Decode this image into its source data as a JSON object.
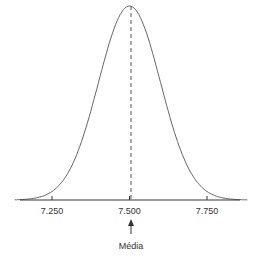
{
  "chart_data": {
    "type": "line",
    "title": "",
    "subtitle": "",
    "xlabel": "",
    "ylabel": "",
    "x_ticks": [
      "7.250",
      "7.500",
      "7.750"
    ],
    "x_tick_values": [
      7250,
      7500,
      7750
    ],
    "xlim": [
      7100,
      7900
    ],
    "mean": 7500,
    "std_dev_approx": 100,
    "grid": false,
    "legend": null,
    "annotations": [
      {
        "text": "Média",
        "x": 7500,
        "type": "arrow-up",
        "position": "below-axis"
      }
    ],
    "reference_lines": [
      {
        "x": 7500,
        "style": "dashed",
        "label": "mean"
      }
    ],
    "colors": {
      "curve": "#666666",
      "axis": "#333333",
      "dashed": "#555555"
    }
  }
}
